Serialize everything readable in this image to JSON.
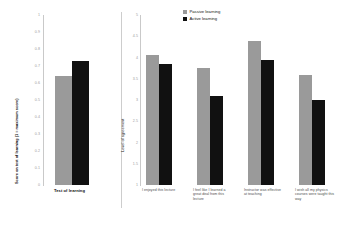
{
  "legend": {
    "entries": [
      {
        "label": "Passive learning",
        "color": "#9a9a9a",
        "key": "passive"
      },
      {
        "label": "Active learning",
        "color": "#111111",
        "key": "active"
      }
    ]
  },
  "chart_data": [
    {
      "type": "bar",
      "id": "test-of-learning",
      "title": "",
      "xlabel": "",
      "ylabel": "Score on test of learning (1 = maximum score)",
      "ylim": [
        0,
        1
      ],
      "ytick_labels": [
        "1",
        "0.9",
        "0.8",
        "0.7",
        "0.6",
        "0.5",
        "0.4",
        "0.3",
        "0.2",
        "0.1",
        "0"
      ],
      "ytick_values": [
        1,
        0.9,
        0.8,
        0.7,
        0.6,
        0.5,
        0.4,
        0.3,
        0.2,
        0.1,
        0
      ],
      "grid": false,
      "categories": [
        "Test of learning"
      ],
      "series": [
        {
          "name": "Passive learning",
          "values": [
            0.64
          ]
        },
        {
          "name": "Active learning",
          "values": [
            0.73
          ]
        }
      ]
    },
    {
      "type": "bar",
      "id": "survey-agreement",
      "title": "",
      "xlabel": "",
      "ylabel": "Level of agreement",
      "ylim": [
        1,
        5
      ],
      "ytick_labels": [
        "5",
        "4.5",
        "4",
        "3.5",
        "3",
        "2.5",
        "2",
        "1.5",
        "1"
      ],
      "ytick_values": [
        5,
        4.5,
        4,
        3.5,
        3,
        2.5,
        2,
        1.5,
        1
      ],
      "grid": false,
      "legend_position": "top-right",
      "categories": [
        "I enjoyed this lecture",
        "I feel like I learned a great deal from this lecture",
        "Instructor was effective at teaching",
        "I wish all my physics courses were taught this way"
      ],
      "series": [
        {
          "name": "Passive learning",
          "values": [
            4.05,
            3.75,
            4.4,
            3.6
          ]
        },
        {
          "name": "Active learning",
          "values": [
            3.85,
            3.1,
            3.95,
            3.0
          ]
        }
      ]
    }
  ]
}
